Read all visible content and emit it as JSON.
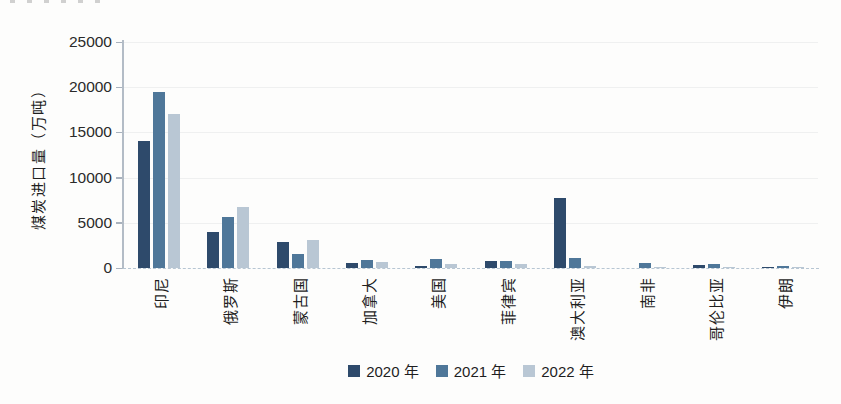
{
  "figure": {
    "y_axis_title": "煤炭进口量（万吨）",
    "legend_items": [
      {
        "label": "2020 年",
        "color": "#2e4a6b"
      },
      {
        "label": "2021 年",
        "color": "#4f7799"
      },
      {
        "label": "2022 年",
        "color": "#b9c7d4"
      }
    ]
  },
  "chart_data": {
    "type": "bar",
    "title": "",
    "xlabel": "",
    "ylabel": "煤炭进口量（万吨）",
    "categories": [
      "印尼",
      "俄罗斯",
      "蒙古国",
      "加拿大",
      "美国",
      "菲律宾",
      "澳大利亚",
      "南非",
      "哥伦比亚",
      "伊朗"
    ],
    "series": [
      {
        "name": "2020 年",
        "color": "#2e4a6b",
        "values": [
          14100,
          4000,
          2900,
          500,
          200,
          800,
          7800,
          0,
          300,
          150
        ]
      },
      {
        "name": "2021 年",
        "color": "#4f7799",
        "values": [
          19500,
          5600,
          1600,
          900,
          1000,
          800,
          1100,
          600,
          400,
          200
        ]
      },
      {
        "name": "2022 年",
        "color": "#b9c7d4",
        "values": [
          17000,
          6700,
          3100,
          700,
          400,
          400,
          200,
          150,
          100,
          100
        ]
      }
    ],
    "ylim": [
      0,
      25000
    ],
    "yticks": [
      0,
      5000,
      10000,
      15000,
      20000,
      25000
    ],
    "grid": "faint horizontal gridlines",
    "legend_position": "bottom"
  }
}
